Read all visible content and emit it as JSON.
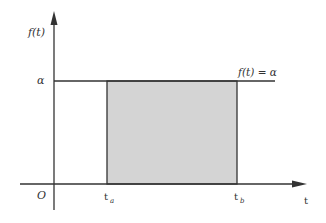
{
  "diagram": {
    "y_axis_label": "f(t)",
    "x_axis_label": "t",
    "origin_label": "O",
    "level_label": "α",
    "function_label": "f(t) = α",
    "start_label": {
      "base": "t",
      "sub": "a"
    },
    "end_label": {
      "base": "t",
      "sub": "b"
    },
    "colors": {
      "axis": "#333333",
      "fill": "#d4d4d4",
      "line": "#333333"
    }
  }
}
